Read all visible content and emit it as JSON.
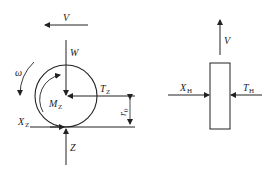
{
  "diagram": {
    "colors": {
      "stroke": "#222222",
      "background": "#ffffff"
    },
    "wheel": {
      "labels": {
        "velocity": "V",
        "weight": "W",
        "angular_velocity": "ω",
        "moment": "M",
        "moment_sub": "Z",
        "traction": "T",
        "traction_sub": "Z",
        "lateral": "X",
        "lateral_sub": "Z",
        "normal": "Z",
        "radius": "r",
        "radius_sub": "0"
      }
    },
    "block": {
      "labels": {
        "velocity": "V",
        "left_force": "X",
        "left_force_sub": "H",
        "right_force": "T",
        "right_force_sub": "H"
      }
    }
  }
}
